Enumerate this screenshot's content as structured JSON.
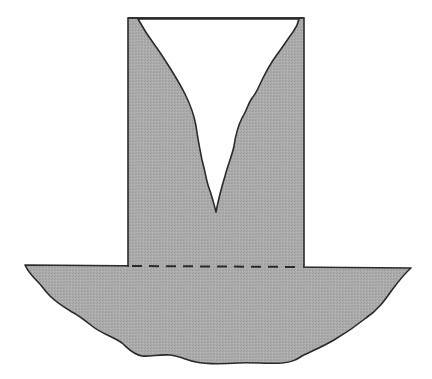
{
  "diagram": {
    "colors": {
      "fill": "#a9a9a9",
      "stroke": "#2a2a2a",
      "notch": "#ffffff",
      "background": "#ffffff"
    },
    "parts": [
      {
        "id": "column",
        "label": ""
      },
      {
        "id": "v-notch",
        "label": ""
      },
      {
        "id": "base",
        "label": ""
      },
      {
        "id": "junction-line",
        "label": "",
        "style": "dashed"
      }
    ]
  }
}
